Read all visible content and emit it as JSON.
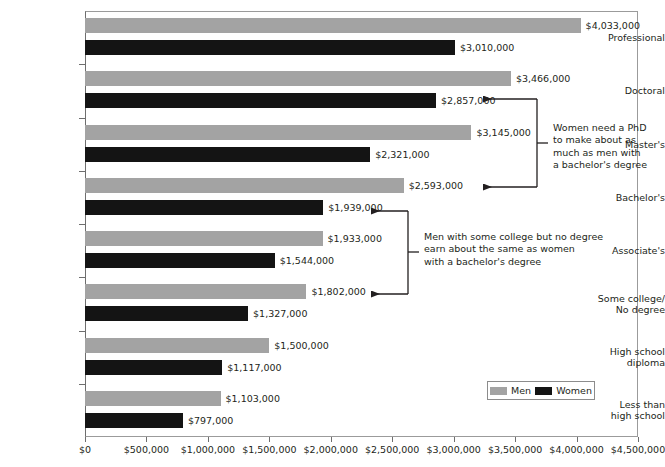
{
  "chart_data": {
    "type": "bar",
    "orientation": "horizontal",
    "grouped": true,
    "title": "",
    "xlabel": "",
    "ylabel": "",
    "xlim": [
      0,
      4500000
    ],
    "xtick_step": 500000,
    "grid": false,
    "legend_position": "bottom-right",
    "value_prefix": "$",
    "categories": [
      "Professional",
      "Doctoral",
      "Master's",
      "Bachelor's",
      "Associate's",
      "Some college/\nNo degree",
      "High school\ndiploma",
      "Less than\nhigh school"
    ],
    "series": [
      {
        "name": "Men",
        "color": "#a3a3a3",
        "values": [
          4033000,
          3466000,
          3145000,
          2593000,
          1933000,
          1802000,
          1500000,
          1103000
        ],
        "labels": [
          "$4,033,000",
          "$3,466,000",
          "$3,145,000",
          "$2,593,000",
          "$1,933,000",
          "$1,802,000",
          "$1,500,000",
          "$1,103,000"
        ]
      },
      {
        "name": "Women",
        "color": "#141414",
        "values": [
          3010000,
          2857000,
          2321000,
          1939000,
          1544000,
          1327000,
          1117000,
          797000
        ],
        "labels": [
          "$3,010,000",
          "$2,857,000",
          "$2,321,000",
          "$1,939,000",
          "$1,544,000",
          "$1,327,000",
          "$1,117,000",
          "$797,000"
        ]
      }
    ],
    "xticks": [
      {
        "value": 0,
        "label": "$0"
      },
      {
        "value": 500000,
        "label": "$500,000"
      },
      {
        "value": 1000000,
        "label": "$1,000,000"
      },
      {
        "value": 1500000,
        "label": "$1,500,000"
      },
      {
        "value": 2000000,
        "label": "$2,000,000"
      },
      {
        "value": 2500000,
        "label": "$2,500,000"
      },
      {
        "value": 3000000,
        "label": "$3,000,000"
      },
      {
        "value": 3500000,
        "label": "$3,500,000"
      },
      {
        "value": 4000000,
        "label": "$4,000,000"
      },
      {
        "value": 4500000,
        "label": "$4,500,000"
      }
    ],
    "annotations": [
      {
        "id": "phd-vs-bachelors",
        "text": "Women need a PhD\nto make about as\nmuch as men with\na bachelor's degree",
        "points_to": [
          "Doctoral / Women ($2,857,000)",
          "Bachelor's / Men ($2,593,000)"
        ]
      },
      {
        "id": "some-college-vs-bachelors",
        "text": "Men with some college but no degree\nearn about the same as women\nwith a bachelor's degree",
        "points_to": [
          "Bachelor's / Women ($1,939,000)",
          "Some college / Men ($1,802,000)"
        ]
      }
    ],
    "legend": [
      {
        "label": "Men",
        "color": "#a3a3a3"
      },
      {
        "label": "Women",
        "color": "#141414"
      }
    ]
  }
}
